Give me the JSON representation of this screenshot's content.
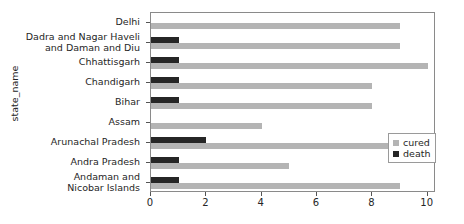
{
  "chart_data": {
    "type": "bar",
    "orientation": "horizontal",
    "title": "",
    "xlabel": "",
    "ylabel": "state_name",
    "xlim": [
      0,
      10.3
    ],
    "xticks": [
      0,
      2,
      4,
      6,
      8,
      10
    ],
    "xticklabels": [
      "0",
      "2",
      "4",
      "6",
      "8",
      "10"
    ],
    "grid": false,
    "legend_position": "center right (inside axes)",
    "categories": [
      "Delhi",
      "Dadra and Nagar Haveli and Daman and Diu",
      "Chhattisgarh",
      "Chandigarh",
      "Bihar",
      "Assam",
      "Arunachal Pradesh",
      "Andra Pradesh",
      "Andaman and Nicobar Islands"
    ],
    "series": [
      {
        "name": "cured",
        "color": "#b4b4b4",
        "values": [
          9,
          9,
          10,
          8,
          8,
          4,
          10.3,
          5,
          9
        ]
      },
      {
        "name": "death",
        "color": "#262626",
        "values": [
          0,
          1,
          1,
          1,
          1,
          0,
          2,
          1,
          1
        ]
      }
    ]
  },
  "axis": {
    "ylabel": "state_name",
    "category_labels": [
      [
        "Delhi"
      ],
      [
        "Dadra and Nagar Haveli",
        "and Daman and Diu"
      ],
      [
        "Chhattisgarh"
      ],
      [
        "Chandigarh"
      ],
      [
        "Bihar"
      ],
      [
        "Assam"
      ],
      [
        "Arunachal Pradesh"
      ],
      [
        "Andra Pradesh"
      ],
      [
        "Andaman and",
        "Nicobar Islands"
      ]
    ],
    "xticklabels": [
      "0",
      "2",
      "4",
      "6",
      "8",
      "10"
    ]
  },
  "legend": {
    "items": [
      {
        "label": "cured",
        "color": "#b4b4b4"
      },
      {
        "label": "death",
        "color": "#262626"
      }
    ]
  }
}
